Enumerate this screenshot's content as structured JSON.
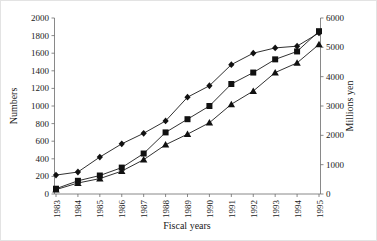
{
  "figure": {
    "background": "#ffffff",
    "border_color": "#e3e3e3",
    "axis_color": "#6b6b6b",
    "line_color": "#1a1a1a",
    "marker_color": "#111111"
  },
  "chart_data": {
    "type": "line",
    "title": "",
    "x": [
      1983,
      1984,
      1985,
      1986,
      1987,
      1988,
      1989,
      1990,
      1991,
      1992,
      1993,
      1994,
      1995
    ],
    "xlabel": "Fiscal years",
    "ylabel_left": "Numbers",
    "ylabel_right": "Millions yen",
    "ylim_left": [
      0,
      2000
    ],
    "ytick_step_left": 200,
    "ylim_right": [
      0,
      6000
    ],
    "ytick_step_right": 1000,
    "grid": false,
    "legend": "none",
    "x_tick_label_rotation_deg": 90,
    "series": [
      {
        "name": "diamond-series",
        "marker": "diamond",
        "values_left_axis_scale": [
          215,
          250,
          420,
          570,
          690,
          830,
          1100,
          1230,
          1470,
          1600,
          1660,
          1680,
          1830
        ]
      },
      {
        "name": "square-series",
        "marker": "square",
        "values_left_axis_scale": [
          60,
          150,
          210,
          300,
          460,
          700,
          850,
          1000,
          1250,
          1380,
          1530,
          1620,
          1850
        ]
      },
      {
        "name": "triangle-series",
        "marker": "triangle",
        "values_left_axis_scale": [
          50,
          125,
          175,
          260,
          390,
          560,
          680,
          810,
          1020,
          1170,
          1380,
          1490,
          1700
        ]
      }
    ]
  }
}
